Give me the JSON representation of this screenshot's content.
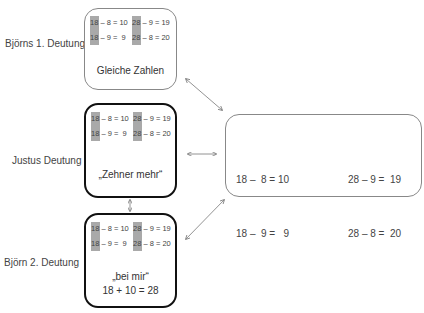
{
  "labels": {
    "bjoern1": "Björns 1. Deutung",
    "justus": "Justus Deutung",
    "bjoern2": "Björn 2. Deutung"
  },
  "equations": {
    "left": [
      "18 – 8 = 10",
      "18 – 9 =  9"
    ],
    "right": [
      "28 – 9 = 19",
      "28 – 8 = 20"
    ]
  },
  "boxes": {
    "bjoern1": {
      "eq_left": [
        "18 – 8 = 10",
        "18 – 9 =  9"
      ],
      "eq_right": [
        "28 – 9 = 19",
        "28 – 8 = 20"
      ],
      "caption": "Gleiche Zahlen"
    },
    "justus": {
      "eq_left": [
        "18 – 8 = 10",
        "18 – 9 =  9"
      ],
      "eq_right": [
        "28 – 9 = 19",
        "28 – 8 = 20"
      ],
      "caption": "„Zehner mehr“"
    },
    "bjoern2": {
      "eq_left": [
        "18 – 8 = 10",
        "18 – 9 =  9"
      ],
      "eq_right": [
        "28 – 9 = 19",
        "28 – 8 = 20"
      ],
      "caption_line1": "„bei mir“",
      "caption_line2": "18 + 10 = 28"
    },
    "task": {
      "eq_left": [
        "18 –  8 = 10",
        "18 –  9 =   9"
      ],
      "eq_right": [
        "28 – 9 =  19",
        "28 – 8 =  20"
      ]
    }
  },
  "colors": {
    "highlight": "#a9a9a9",
    "thick_border": "#111111",
    "thin_border": "#888888",
    "arrow": "#777777"
  }
}
